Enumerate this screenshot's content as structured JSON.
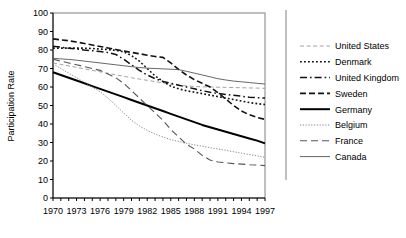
{
  "chart_data": {
    "type": "line",
    "title": "",
    "xlabel": "",
    "ylabel": "Participation Rate",
    "xlim": [
      1970,
      1997
    ],
    "ylim": [
      0,
      100
    ],
    "ytick_labels": [
      "0",
      "10",
      "20",
      "30",
      "40",
      "50",
      "60",
      "70",
      "80",
      "90",
      "100"
    ],
    "yticks": [
      0,
      10,
      20,
      30,
      40,
      50,
      60,
      70,
      80,
      90,
      100
    ],
    "xtick_labels": [
      "1970",
      "1973",
      "1976",
      "1979",
      "1982",
      "1985",
      "1988",
      "1991",
      "1994",
      "1997"
    ],
    "xticks": [
      1970,
      1973,
      1976,
      1979,
      1982,
      1985,
      1988,
      1991,
      1994,
      1997
    ],
    "x": [
      1970,
      1971,
      1972,
      1973,
      1974,
      1975,
      1976,
      1977,
      1978,
      1979,
      1980,
      1981,
      1982,
      1983,
      1984,
      1985,
      1986,
      1987,
      1988,
      1989,
      1990,
      1991,
      1992,
      1993,
      1994,
      1995,
      1996,
      1997
    ],
    "grid": false,
    "legend_position": "right",
    "series": [
      {
        "name": "United States",
        "style": "dash-fine",
        "color": "#999999",
        "values": [
          73.0,
          72.2,
          71.4,
          70.6,
          69.8,
          69.0,
          68.2,
          67.4,
          66.6,
          65.8,
          65.0,
          64.3,
          63.6,
          62.9,
          62.2,
          61.5,
          61.0,
          60.6,
          60.3,
          60.1,
          60.0,
          59.9,
          59.8,
          59.7,
          59.6,
          59.5,
          59.4,
          59.3
        ]
      },
      {
        "name": "Denmark",
        "style": "dotted",
        "color": "#111111",
        "values": [
          81.0,
          81.0,
          81.0,
          81.0,
          81.0,
          80.8,
          80.5,
          80.2,
          79.8,
          79.0,
          77.0,
          74.0,
          70.0,
          66.0,
          63.0,
          60.5,
          59.0,
          58.0,
          57.2,
          56.4,
          55.6,
          54.8,
          54.0,
          53.2,
          52.4,
          51.6,
          51.0,
          50.5
        ]
      },
      {
        "name": "United Kingdom",
        "style": "dashdot",
        "color": "#111111",
        "values": [
          82.0,
          81.5,
          81.0,
          80.5,
          80.0,
          79.6,
          79.2,
          78.6,
          77.6,
          75.0,
          72.0,
          69.0,
          66.5,
          64.5,
          63.0,
          62.0,
          61.0,
          60.0,
          59.0,
          58.0,
          57.2,
          56.5,
          56.0,
          55.5,
          55.0,
          54.5,
          54.2,
          54.0
        ]
      },
      {
        "name": "Sweden",
        "style": "dashed",
        "color": "#111111",
        "values": [
          86.0,
          85.5,
          85.0,
          84.3,
          83.5,
          82.7,
          81.9,
          81.1,
          80.3,
          79.5,
          78.7,
          78.0,
          77.2,
          76.5,
          76.0,
          73.0,
          69.5,
          66.5,
          64.0,
          62.0,
          60.0,
          57.0,
          53.5,
          50.0,
          47.0,
          45.0,
          43.5,
          42.5
        ]
      },
      {
        "name": "Germany",
        "style": "solid-thick",
        "color": "#000000",
        "values": [
          68.0,
          66.5,
          65.0,
          63.5,
          62.0,
          60.5,
          59.0,
          57.5,
          56.0,
          54.5,
          53.0,
          51.5,
          50.0,
          48.5,
          47.0,
          45.5,
          44.0,
          42.5,
          41.0,
          39.5,
          38.2,
          37.0,
          35.8,
          34.6,
          33.4,
          32.2,
          31.0,
          29.5
        ]
      },
      {
        "name": "Belgium",
        "style": "dotted-fine",
        "color": "#777777",
        "values": [
          72.5,
          70.0,
          67.5,
          65.0,
          62.5,
          60.0,
          57.5,
          54.0,
          50.0,
          46.0,
          42.0,
          39.0,
          36.5,
          34.5,
          33.0,
          31.5,
          30.5,
          29.5,
          28.8,
          28.0,
          27.2,
          26.5,
          25.8,
          25.0,
          24.2,
          23.5,
          22.8,
          22.0
        ]
      },
      {
        "name": "France",
        "style": "dash-long",
        "color": "#555555",
        "values": [
          75.0,
          74.0,
          73.0,
          72.0,
          71.0,
          70.0,
          69.0,
          67.0,
          65.0,
          62.0,
          58.0,
          54.0,
          50.0,
          46.0,
          42.0,
          37.0,
          33.0,
          29.0,
          26.5,
          23.0,
          20.5,
          19.5,
          19.0,
          18.6,
          18.3,
          18.0,
          17.8,
          17.5
        ]
      },
      {
        "name": "Canada",
        "style": "solid-thin",
        "color": "#555555",
        "values": [
          75.5,
          75.2,
          74.9,
          74.5,
          74.0,
          73.5,
          73.0,
          72.5,
          72.0,
          71.5,
          71.0,
          70.5,
          70.2,
          70.0,
          69.8,
          69.6,
          69.4,
          68.5,
          67.5,
          66.5,
          65.5,
          64.5,
          63.8,
          63.2,
          62.8,
          62.4,
          62.0,
          61.6
        ]
      }
    ]
  },
  "legend": {
    "items": [
      {
        "label": "United States"
      },
      {
        "label": "Denmark"
      },
      {
        "label": "United Kingdom"
      },
      {
        "label": "Sweden"
      },
      {
        "label": "Germany"
      },
      {
        "label": "Belgium"
      },
      {
        "label": "France"
      },
      {
        "label": "Canada"
      }
    ]
  }
}
